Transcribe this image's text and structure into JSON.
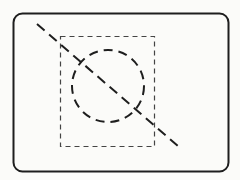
{
  "diagram": {
    "background": "#fbfbf9",
    "stroke_color": "#1e1e1e",
    "dashed_color": "#444444",
    "frame": {
      "x": 13.5,
      "y": 13.5,
      "width": 215,
      "height": 158,
      "rx": 9
    },
    "inner_rect": {
      "x": 60.5,
      "y": 36.5,
      "width": 94,
      "height": 110
    },
    "circle": {
      "cx": 108,
      "cy": 86,
      "rx": 36,
      "ry": 36
    },
    "diagonal": {
      "x1": 37,
      "y1": 24,
      "x2": 178,
      "y2": 146
    }
  }
}
